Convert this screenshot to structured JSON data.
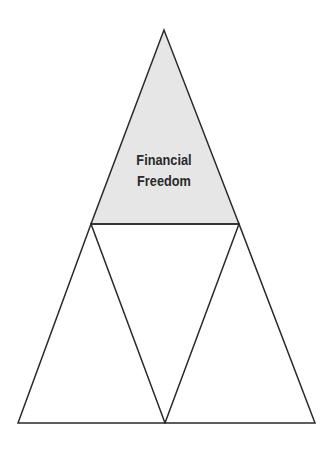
{
  "diagram": {
    "type": "pyramid",
    "top_label_line1": "Financial",
    "top_label_line2": "Freedom",
    "colors": {
      "top_fill": "#e6e6e6",
      "stroke": "#2a2a2a",
      "background": "#ffffff"
    },
    "sections": [
      {
        "position": "top",
        "label": "Financial Freedom",
        "filled": true
      },
      {
        "position": "bottom-left",
        "label": "",
        "filled": false
      },
      {
        "position": "bottom-middle-inverted",
        "label": "",
        "filled": false
      },
      {
        "position": "bottom-right",
        "label": "",
        "filled": false
      }
    ]
  }
}
